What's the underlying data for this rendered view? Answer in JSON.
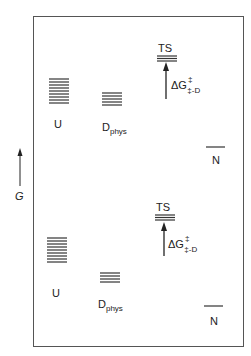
{
  "axis": {
    "label": "G",
    "direction": "up"
  },
  "panels": [
    {
      "id": "top",
      "states": [
        {
          "name": "U",
          "label": "U",
          "subscript": "",
          "levels": 10
        },
        {
          "name": "D_phys",
          "label": "D",
          "subscript": "phys",
          "levels": 6
        },
        {
          "name": "TS",
          "label": "TS",
          "subscript": "",
          "levels": 3
        },
        {
          "name": "N",
          "label": "N",
          "subscript": "",
          "levels": 1
        }
      ],
      "barrier": {
        "symbol": "ΔG",
        "superscript": "‡",
        "subscript": "‡-D"
      }
    },
    {
      "id": "bottom",
      "states": [
        {
          "name": "U",
          "label": "U",
          "subscript": "",
          "levels": 10
        },
        {
          "name": "D_phys",
          "label": "D",
          "subscript": "phys",
          "levels": 6
        },
        {
          "name": "TS",
          "label": "TS",
          "subscript": "",
          "levels": 3
        },
        {
          "name": "N",
          "label": "N",
          "subscript": "",
          "levels": 1
        }
      ],
      "barrier": {
        "symbol": "ΔG",
        "superscript": "‡",
        "subscript": "‡-D"
      }
    }
  ],
  "colors": {
    "line": "#333333",
    "frame": "#555555",
    "background": "#ffffff"
  }
}
